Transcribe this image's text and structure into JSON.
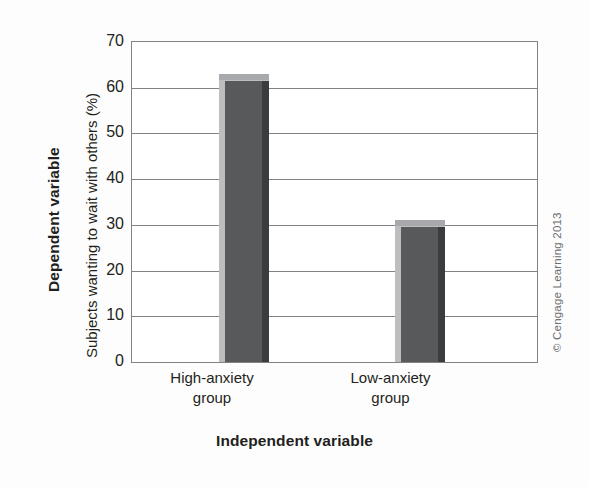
{
  "chart_data": {
    "type": "bar",
    "title": "",
    "subtitle": "",
    "categories": [
      "High-anxiety group",
      "Low-anxiety group"
    ],
    "category_lines": [
      [
        "High-anxiety",
        "group"
      ],
      [
        "Low-anxiety",
        "group"
      ]
    ],
    "values": [
      63,
      31
    ],
    "series": [
      {
        "name": "Subjects wanting to wait with others (%)",
        "values": [
          63,
          31
        ]
      }
    ],
    "xlabel": "Independent variable",
    "ylabel": "Subjects wanting to wait with others (%)",
    "y_axis_group_label": "Dependent variable",
    "ylim": [
      0,
      70
    ],
    "yticks": [
      70,
      60,
      50,
      40,
      30,
      20,
      10,
      0
    ],
    "ytick_labels": [
      "70",
      "60",
      "50",
      "40",
      "30",
      "20",
      "10",
      "0"
    ],
    "grid": "horizontal",
    "legend": "none",
    "annotations": [
      "© Cengage Learning 2013"
    ],
    "colors": {
      "bar_front": "#58595b",
      "bar_top": "#a7a9ac",
      "bar_left": "#bcbec0",
      "bar_right": "#3b3c3d",
      "grid": "#808285",
      "axis": "#808285",
      "plot_background": "#ffffff",
      "text": "#231f20",
      "credit_text": "#6d6e71"
    }
  },
  "credit": {
    "text": "© Cengage Learning 2013"
  }
}
